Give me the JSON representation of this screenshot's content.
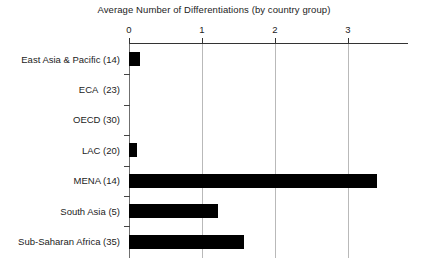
{
  "chart_data": {
    "type": "bar",
    "orientation": "horizontal",
    "title": "Average Number of Differentiations (by country group)",
    "xlabel": "",
    "ylabel": "",
    "categories": [
      "East Asia & Pacific (14)",
      "ECA  (23)",
      "OECD (30)",
      "LAC (20)",
      "MENA (14)",
      "South Asia (5)",
      "Sub-Saharan Africa (35)"
    ],
    "values": [
      0.15,
      0.0,
      0.0,
      0.11,
      3.4,
      1.22,
      1.58
    ],
    "xticks": [
      0,
      1,
      2,
      3
    ],
    "xtick_labels": [
      "0",
      "1",
      "2",
      "3"
    ],
    "xlim": [
      0,
      3.82
    ],
    "grid": "vertical",
    "legend": "none",
    "bar_color": "#000000",
    "gridline_color": "#b9b9b9",
    "axis_color": "#333333",
    "background": "#ffffff"
  }
}
